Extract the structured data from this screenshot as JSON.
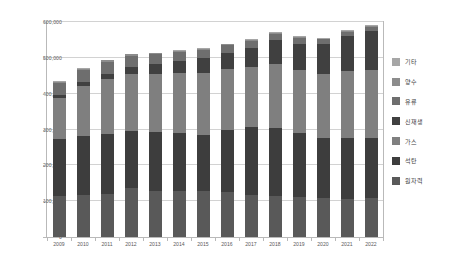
{
  "chart_data": {
    "type": "bar",
    "subtype": "stacked-bar",
    "title": "",
    "xlabel": "",
    "ylabel": "",
    "ylim": [
      0,
      600000
    ],
    "ytick_values": [
      0,
      100000,
      200000,
      300000,
      400000,
      500000,
      600000
    ],
    "ytick_labels": [
      "0",
      "100,000",
      "200,000",
      "300,000",
      "400,000",
      "500,000",
      "600,000"
    ],
    "grid": true,
    "legend_position": "right",
    "categories": [
      "2009",
      "2010",
      "2011",
      "2012",
      "2013",
      "2014",
      "2015",
      "2016",
      "2017",
      "2018",
      "2019",
      "2020",
      "2021",
      "2022"
    ],
    "stack_order_bottom_to_top": [
      "원자력",
      "석탄",
      "가스",
      "신재생",
      "유류",
      "양수",
      "기타"
    ],
    "series": [
      {
        "name": "원자력",
        "color": "#595959",
        "values": [
          17716,
          17716,
          17716,
          20716,
          20716,
          20716,
          21716,
          23116,
          22529,
          21850,
          23250,
          23250,
          23250,
          24650
        ]
      },
      {
        "name": "석탄",
        "color": "#3d3d3d",
        "values": [
          24535,
          24535,
          24535,
          24535,
          26535,
          26535,
          26535,
          31485,
          36685,
          36685,
          36685,
          36685,
          37335,
          38300
        ]
      },
      {
        "name": "가스",
        "color": "#7f7f7f",
        "values": [
          17700,
          20800,
          22800,
          24300,
          25800,
          27300,
          29300,
          30800,
          32400,
          34400,
          36400,
          38400,
          41400,
          43400
        ]
      },
      {
        "name": "신재생",
        "color": "#404040",
        "values": [
          1200,
          1700,
          2300,
          3200,
          4300,
          5400,
          6800,
          8400,
          10400,
          12800,
          15200,
          17800,
          21400,
          24900
        ]
      },
      {
        "name": "유류",
        "color": "#6e6e6e",
        "values": [
          5400,
          5100,
          4900,
          4700,
          4500,
          4300,
          4100,
          3900,
          3700,
          3500,
          3200,
          3000,
          2800,
          2600
        ]
      },
      {
        "name": "양수",
        "color": "#8c8c8c",
        "values": [
          470,
          470,
          470,
          470,
          470,
          470,
          470,
          470,
          470,
          470,
          470,
          470,
          470,
          470
        ]
      },
      {
        "name": "기타",
        "color": "#a6a6a6",
        "values": [
          300,
          320,
          340,
          360,
          380,
          400,
          420,
          440,
          460,
          480,
          500,
          520,
          540,
          560
        ]
      }
    ],
    "totals": [
      435000,
      472000,
      495000,
      512000,
      515000,
      522000,
      528000,
      540000,
      552000,
      572000,
      560000,
      556000,
      578000,
      592000
    ]
  },
  "legend": {
    "items": [
      {
        "label": "기타",
        "color": "#a6a6a6"
      },
      {
        "label": "양수",
        "color": "#8c8c8c"
      },
      {
        "label": "유류",
        "color": "#6e6e6e"
      },
      {
        "label": "신재생",
        "color": "#404040"
      },
      {
        "label": "가스",
        "color": "#7f7f7f"
      },
      {
        "label": "석탄",
        "color": "#3d3d3d"
      },
      {
        "label": "원자력",
        "color": "#595959"
      }
    ]
  }
}
